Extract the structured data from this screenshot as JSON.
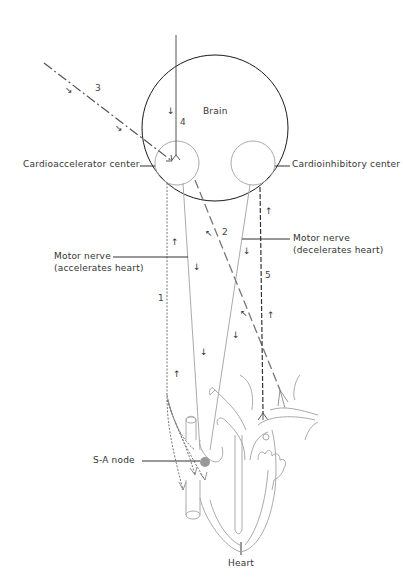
{
  "diagram": {
    "labels": {
      "brain": "Brain",
      "cardioaccelerator": "Cardioaccelerator center",
      "cardioinhibitory": "Cardioinhibitory center",
      "motor_accel_line1": "Motor nerve",
      "motor_accel_line2": "(accelerates heart)",
      "motor_decel_line1": "Motor nerve",
      "motor_decel_line2": "(decelerates heart)",
      "sa_node": "S-A node",
      "heart": "Heart"
    },
    "pathway_numbers": {
      "n1": "1",
      "n2": "2",
      "n3": "3",
      "n4": "4",
      "n5": "5"
    },
    "arrows": {
      "down": "↓",
      "up": "↑",
      "diag_down": "↘",
      "diag_up": "↖"
    },
    "colors": {
      "outline": "#1a1a1a",
      "nerve": "#999999",
      "dashed": "#555555",
      "heart": "#aaaaaa",
      "sa_node": "#999999"
    }
  }
}
